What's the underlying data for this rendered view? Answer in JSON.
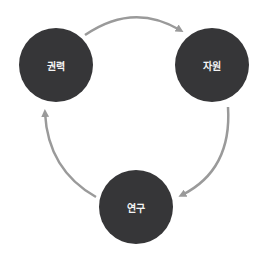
{
  "diagram": {
    "type": "cycle",
    "colors": {
      "node_fill": "#363638",
      "node_text": "#f4f4f4",
      "arrow": "#9a9a9a",
      "background": "#ffffff"
    },
    "nodes": [
      {
        "id": "power",
        "label": "권력"
      },
      {
        "id": "resources",
        "label": "자원"
      },
      {
        "id": "research",
        "label": "연구"
      }
    ],
    "edges": [
      {
        "from": "권력",
        "to": "자원"
      },
      {
        "from": "자원",
        "to": "연구"
      },
      {
        "from": "연구",
        "to": "권력"
      }
    ]
  }
}
